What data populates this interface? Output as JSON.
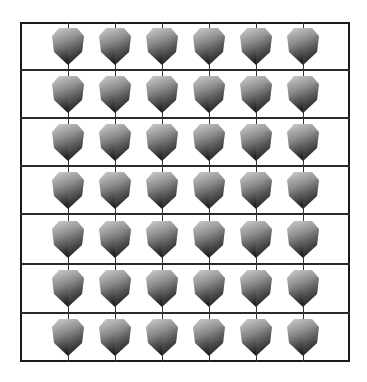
{
  "diagram": {
    "type": "grid-of-cubes",
    "rows": 7,
    "columns": 6,
    "cube_count": 42,
    "frame": {
      "left": 20,
      "top": 22,
      "width": 330,
      "height": 340
    },
    "row_lines_y": [
      70,
      118,
      166,
      214,
      264,
      313
    ],
    "row_centers_y": [
      46,
      94,
      142,
      190,
      239,
      288,
      337
    ],
    "column_centers_x": [
      68,
      115,
      162,
      209,
      256,
      303
    ],
    "cube": {
      "width": 34,
      "height": 40,
      "icon": "shaded-cube-icon"
    },
    "colors": {
      "background": "#ffffff",
      "lines": "#1a1a1a",
      "cube_light": "#c8c8c8",
      "cube_mid": "#7a7a7a",
      "cube_dark": "#1e1e1e"
    }
  }
}
